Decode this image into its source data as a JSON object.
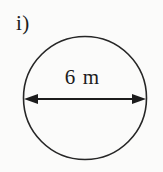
{
  "figure": {
    "item_label": "i)",
    "shape": "circle",
    "dimension_label": "6 m",
    "dimension_kind": "diameter",
    "dimension_value": 6,
    "dimension_unit": "m",
    "stroke_color": "#262626",
    "arrow_color": "#1c1c1c",
    "text_color": "#1c1c1c",
    "background_color": "#fbfbfa",
    "geometry": {
      "center_x": 85,
      "center_y": 98,
      "radius": 62,
      "arrow_y": 99,
      "arrow_left_x": 24,
      "arrow_right_x": 146,
      "arrowhead_length": 14,
      "arrowhead_half_height": 5
    }
  }
}
